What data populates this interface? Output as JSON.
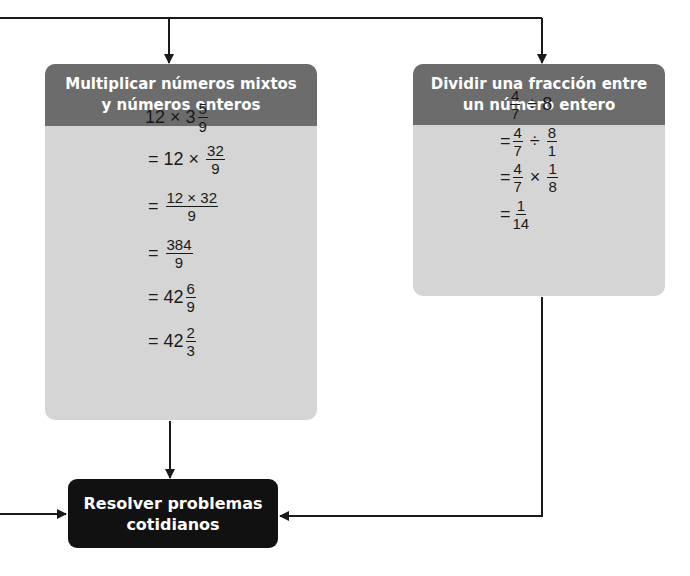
{
  "diagram": {
    "left_card": {
      "title_line1": "Multiplicar números mixtos",
      "title_line2": "y números enteros",
      "steps": [
        {
          "prefix": "",
          "parts": [
            "12",
            "×",
            "3"
          ],
          "frac": [
            "5",
            "9"
          ]
        },
        {
          "prefix": "=",
          "parts": [
            "12",
            "×"
          ],
          "frac": [
            "32",
            "9"
          ]
        },
        {
          "prefix": "=",
          "frac": [
            "12 × 32",
            "9"
          ]
        },
        {
          "prefix": "=",
          "frac": [
            "384",
            "9"
          ]
        },
        {
          "prefix": "=",
          "whole": "42",
          "frac": [
            "6",
            "9"
          ]
        },
        {
          "prefix": "=",
          "whole": "42",
          "frac": [
            "2",
            "3"
          ]
        }
      ]
    },
    "right_card": {
      "title_line1": "Dividir una fracción entre",
      "title_line2": "un número entero",
      "steps": [
        {
          "prefix": "",
          "f1": [
            "4",
            "7"
          ],
          "op": "÷",
          "tail": "8"
        },
        {
          "prefix": "=",
          "f1": [
            "4",
            "7"
          ],
          "op": "÷",
          "f2": [
            "8",
            "1"
          ]
        },
        {
          "prefix": "=",
          "f1": [
            "4",
            "7"
          ],
          "op": "×",
          "f2": [
            "1",
            "8"
          ]
        },
        {
          "prefix": "=",
          "f1": [
            "1",
            "14"
          ]
        }
      ]
    },
    "final_box": {
      "line1": "Resolver problemas",
      "line2": "cotidianos"
    },
    "colors": {
      "header": "#6c6c6c",
      "body": "#d5d5d5",
      "final": "#111111",
      "line": "#1a1a1a"
    }
  }
}
